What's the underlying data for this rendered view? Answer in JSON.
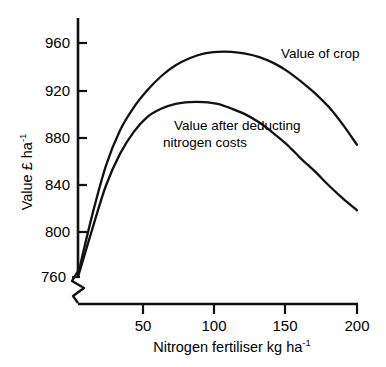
{
  "chart_data": {
    "type": "line",
    "title": "",
    "subtitle": "",
    "xlabel": "Nitrogen fertiliser  kg ha",
    "xlabel_sup": "-1",
    "ylabel": "Value  £  ha",
    "ylabel_sup": "-1",
    "xlim": [
      0,
      200
    ],
    "ylim": [
      760,
      975
    ],
    "y_axis_break": true,
    "y_axis_break_note": "zigzag break below 760",
    "grid": false,
    "legend": "inline-curve-labels",
    "xticks": [
      50,
      100,
      150,
      200
    ],
    "xtick_labels": [
      "50",
      "100",
      "150",
      "200"
    ],
    "yticks": [
      760,
      800,
      840,
      880,
      920,
      960
    ],
    "ytick_labels": [
      "760",
      "800",
      "840",
      "880",
      "920",
      "960"
    ],
    "series": [
      {
        "name": "Value of crop",
        "label": "Value of crop",
        "label_x": 160,
        "label_y": 955,
        "x": [
          0,
          10,
          20,
          30,
          40,
          50,
          60,
          70,
          80,
          90,
          100,
          110,
          120,
          130,
          140,
          150,
          160,
          170,
          180,
          190,
          200
        ],
        "values": [
          762,
          812,
          855,
          885,
          905,
          920,
          932,
          941,
          947,
          951,
          952.5,
          952.5,
          951,
          948,
          943,
          936,
          927,
          917,
          905,
          890,
          873
        ]
      },
      {
        "name": "Value after deducting nitrogen costs",
        "label": "Value after deducting\nnitrogen costs",
        "label_line1": "Value after deducting",
        "label_line2": "nitrogen costs",
        "label_x": 75,
        "label_y": 890,
        "x": [
          0,
          10,
          20,
          30,
          40,
          50,
          60,
          70,
          80,
          90,
          100,
          110,
          120,
          130,
          140,
          150,
          160,
          170,
          180,
          190,
          200
        ],
        "values": [
          760,
          800,
          838,
          865,
          884,
          897,
          904,
          908,
          909.5,
          909.5,
          908,
          904,
          899,
          892,
          883,
          873,
          861,
          850,
          838,
          827,
          817
        ]
      }
    ],
    "annotations": [
      {
        "text": "Value of crop",
        "x": 160,
        "y": 955
      },
      {
        "text": "Value after deducting nitrogen costs",
        "x": 75,
        "y": 890
      }
    ],
    "colors": {
      "curve": "#111111",
      "axis": "#111111",
      "background": "#ffffff"
    }
  }
}
